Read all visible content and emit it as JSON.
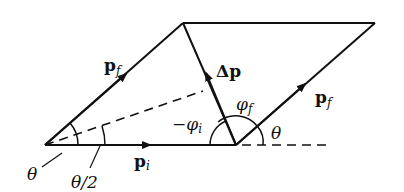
{
  "diagram": {
    "type": "vector-parallelogram",
    "labels": {
      "pf_left": "p",
      "pf_left_sub": "f",
      "pf_right": "p",
      "pf_right_sub": "f",
      "pi": "p",
      "pi_sub": "i",
      "delta_p": "Δp",
      "phi_i": "−φ",
      "phi_i_sub": "i",
      "phi_f": "φ",
      "phi_f_sub": "f",
      "theta_left": "θ",
      "theta_half": "θ/2",
      "theta_right": "θ"
    },
    "colors": {
      "ink": "#111111",
      "background": "#ffffff"
    }
  }
}
